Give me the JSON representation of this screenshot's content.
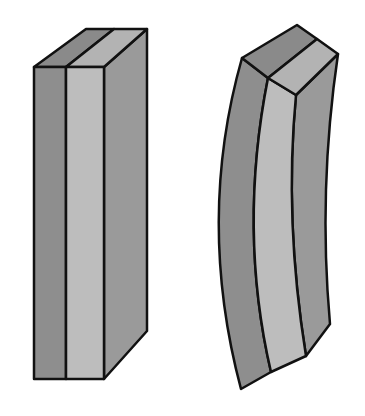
{
  "figure": {
    "colors": {
      "dark_layer": "#8e8e8e",
      "light_layer": "#bdbdbd",
      "side_face": "#9a9a9a",
      "top_dark": "#8a8a8a",
      "top_light": "#b3b3b3",
      "outline": "#111111"
    },
    "objects": [
      {
        "name": "straight-strip",
        "state": "unbent"
      },
      {
        "name": "bent-strip",
        "state": "bent"
      }
    ]
  }
}
